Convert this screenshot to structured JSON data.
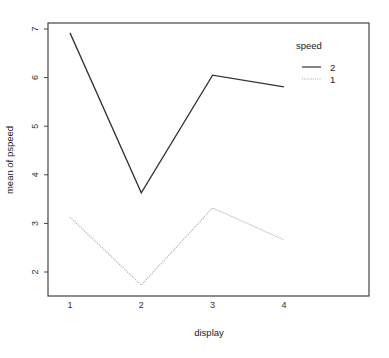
{
  "chart_data": {
    "type": "line",
    "title": "",
    "xlabel": "display",
    "ylabel": "mean of pspeed",
    "x": [
      1,
      2,
      3,
      4
    ],
    "categories": [
      "1",
      "2",
      "3",
      "4"
    ],
    "yticks": [
      2,
      3,
      4,
      5,
      6,
      7
    ],
    "ylim": [
      1.5,
      7.1
    ],
    "xlim": [
      0.7,
      5.2
    ],
    "grid": false,
    "legend": {
      "title": "speed",
      "position": "top-right-inside"
    },
    "series": [
      {
        "name": "2",
        "linestyle": "solid",
        "color": "#333333",
        "values": [
          6.92,
          3.63,
          6.05,
          5.81
        ]
      },
      {
        "name": "1",
        "linestyle": "dotted",
        "color": "#aaaaaa",
        "values": [
          3.13,
          1.73,
          3.32,
          2.66
        ]
      }
    ]
  }
}
